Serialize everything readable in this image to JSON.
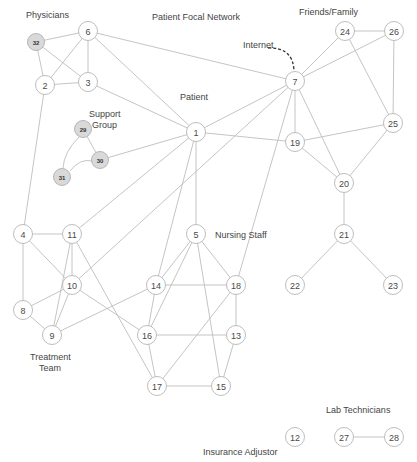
{
  "diagram": {
    "title": "Patient Focal Network",
    "colors": {
      "edge": "#bdbdbd",
      "node_stroke": "#b5b5b5",
      "shaded_fill": "#d9d9d9",
      "text": "#444444",
      "internet_arrow": "#333333"
    },
    "labels": {
      "physicians": "Physicians",
      "title": "Patient Focal Network",
      "friends_family": "Friends/Family",
      "internet": "Internet",
      "patient": "Patient",
      "support_line1": "Support",
      "support_line2": "Group",
      "nursing_staff": "Nursing Staff",
      "treatment_line1": "Treatment",
      "treatment_line2": "Team",
      "lab_technicians": "Lab Technicians",
      "insurance_adjustor": "Insurance Adjustor"
    },
    "nodes": [
      {
        "id": "1",
        "x": 196,
        "y": 132
      },
      {
        "id": "2",
        "x": 45,
        "y": 85
      },
      {
        "id": "3",
        "x": 88,
        "y": 82
      },
      {
        "id": "4",
        "x": 23,
        "y": 234
      },
      {
        "id": "5",
        "x": 196,
        "y": 234
      },
      {
        "id": "6",
        "x": 88,
        "y": 31
      },
      {
        "id": "7",
        "x": 295,
        "y": 81
      },
      {
        "id": "8",
        "x": 23,
        "y": 310
      },
      {
        "id": "9",
        "x": 52,
        "y": 335
      },
      {
        "id": "10",
        "x": 72,
        "y": 285
      },
      {
        "id": "11",
        "x": 72,
        "y": 234
      },
      {
        "id": "12",
        "x": 295,
        "y": 437
      },
      {
        "id": "13",
        "x": 236,
        "y": 335
      },
      {
        "id": "14",
        "x": 156,
        "y": 285
      },
      {
        "id": "15",
        "x": 221,
        "y": 386
      },
      {
        "id": "16",
        "x": 147,
        "y": 335
      },
      {
        "id": "17",
        "x": 157,
        "y": 386
      },
      {
        "id": "18",
        "x": 236,
        "y": 285
      },
      {
        "id": "19",
        "x": 295,
        "y": 142
      },
      {
        "id": "20",
        "x": 344,
        "y": 183
      },
      {
        "id": "21",
        "x": 344,
        "y": 234
      },
      {
        "id": "22",
        "x": 295,
        "y": 285
      },
      {
        "id": "23",
        "x": 393,
        "y": 285
      },
      {
        "id": "24",
        "x": 345,
        "y": 31
      },
      {
        "id": "25",
        "x": 393,
        "y": 123
      },
      {
        "id": "26",
        "x": 394,
        "y": 31
      },
      {
        "id": "27",
        "x": 344,
        "y": 437
      },
      {
        "id": "28",
        "x": 394,
        "y": 437
      },
      {
        "id": "29",
        "x": 83,
        "y": 129,
        "shaded": true
      },
      {
        "id": "30",
        "x": 100,
        "y": 160,
        "shaded": true
      },
      {
        "id": "31",
        "x": 62,
        "y": 177,
        "shaded": true
      },
      {
        "id": "32",
        "x": 36,
        "y": 42,
        "shaded": true
      }
    ],
    "edges": [
      [
        "32",
        "6"
      ],
      [
        "32",
        "2"
      ],
      [
        "32",
        "3"
      ],
      [
        "6",
        "2"
      ],
      [
        "6",
        "3"
      ],
      [
        "2",
        "3"
      ],
      [
        "6",
        "7"
      ],
      [
        "6",
        "1"
      ],
      [
        "3",
        "1"
      ],
      [
        "2",
        "4"
      ],
      [
        "29",
        "30"
      ],
      [
        "30",
        "1"
      ],
      [
        "1",
        "7"
      ],
      [
        "1",
        "19"
      ],
      [
        "1",
        "11"
      ],
      [
        "1",
        "14"
      ],
      [
        "1",
        "5"
      ],
      [
        "7",
        "24"
      ],
      [
        "7",
        "26"
      ],
      [
        "7",
        "19"
      ],
      [
        "7",
        "20"
      ],
      [
        "7",
        "10"
      ],
      [
        "7",
        "18"
      ],
      [
        "24",
        "26"
      ],
      [
        "24",
        "25"
      ],
      [
        "26",
        "25"
      ],
      [
        "25",
        "19"
      ],
      [
        "25",
        "20"
      ],
      [
        "19",
        "20"
      ],
      [
        "20",
        "21"
      ],
      [
        "21",
        "22"
      ],
      [
        "21",
        "23"
      ],
      [
        "4",
        "11"
      ],
      [
        "4",
        "8"
      ],
      [
        "4",
        "10"
      ],
      [
        "11",
        "10"
      ],
      [
        "11",
        "9"
      ],
      [
        "11",
        "17"
      ],
      [
        "10",
        "8"
      ],
      [
        "10",
        "9"
      ],
      [
        "10",
        "16"
      ],
      [
        "9",
        "8"
      ],
      [
        "9",
        "14"
      ],
      [
        "14",
        "5"
      ],
      [
        "14",
        "18"
      ],
      [
        "14",
        "16"
      ],
      [
        "5",
        "16"
      ],
      [
        "5",
        "15"
      ],
      [
        "5",
        "18"
      ],
      [
        "18",
        "13"
      ],
      [
        "18",
        "17"
      ],
      [
        "16",
        "13"
      ],
      [
        "16",
        "17"
      ],
      [
        "13",
        "15"
      ],
      [
        "17",
        "15"
      ],
      [
        "27",
        "28"
      ]
    ],
    "curved_edges": [
      {
        "from": "29",
        "to": "31",
        "path": "M 79 137 Q 64 152 63 168"
      },
      {
        "from": "31",
        "to": "30",
        "path": "M 70 171 Q 80 158 92 161"
      }
    ],
    "internet_arrow": {
      "path": "M 268 48 Q 293 47 294 71"
    }
  }
}
